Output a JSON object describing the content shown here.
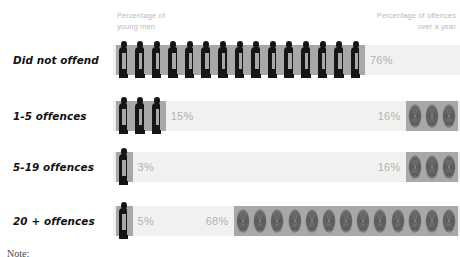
{
  "headers": {
    "left": "Percentage of\nyoung men",
    "right": "Percentage of offences\nover a year"
  },
  "footer": {
    "note": "Note:"
  },
  "colors": {
    "track": "#f1f1f1",
    "icon_block": "#a8a8a8",
    "silhouette": "#151515",
    "label_text": "#111111",
    "percent_text": "#b2b2b2",
    "header_text": "#b9b9b9",
    "background": "#ffffff"
  },
  "chart_data": {
    "type": "bar",
    "title": "",
    "subtitle": "",
    "xlabel": "",
    "ylabel": "",
    "grid": false,
    "legend": "none",
    "categories": [
      "Did not offend",
      "1-5 offences",
      "5-19 offences",
      "20 + offences"
    ],
    "series": [
      {
        "name": "Percentage of young men",
        "values": [
          76,
          15,
          3,
          5
        ],
        "unit": "%",
        "icon": "person-icon"
      },
      {
        "name": "Percentage of offences over a year",
        "values": [
          0,
          16,
          16,
          68
        ],
        "unit": "%",
        "icon": "fingerprint-icon"
      }
    ]
  },
  "rows": [
    {
      "label": "Did not offend",
      "men_percent": "76%",
      "men_icon_count": 15,
      "offence_percent": "",
      "offence_icon_count": 0
    },
    {
      "label": "1-5 offences",
      "men_percent": "15%",
      "men_icon_count": 3,
      "offence_percent": "16%",
      "offence_icon_count": 3
    },
    {
      "label": "5-19 offences",
      "men_percent": "3%",
      "men_icon_count": 1,
      "offence_percent": "16%",
      "offence_icon_count": 3
    },
    {
      "label": "20 + offences",
      "men_percent": "5%",
      "men_icon_count": 1,
      "offence_percent": "68%",
      "offence_icon_count": 13
    }
  ]
}
